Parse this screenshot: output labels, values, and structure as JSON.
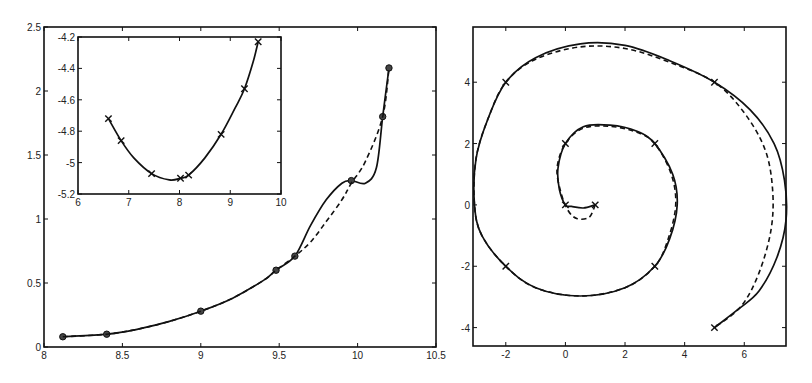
{
  "chart_data": [
    {
      "id": "left",
      "type": "line",
      "title": "",
      "xlabel": "",
      "ylabel": "",
      "xlim": [
        8,
        10.5
      ],
      "ylim": [
        0,
        2.5
      ],
      "xticks": [
        8,
        8.5,
        9,
        9.5,
        10,
        10.5
      ],
      "xtick_labels": [
        "8",
        "8.5",
        "9",
        "9.5",
        "10",
        "10.5"
      ],
      "yticks": [
        0,
        0.5,
        1,
        1.5,
        2,
        2.5
      ],
      "ytick_labels": [
        "0",
        "0.5",
        "1",
        "1.5",
        "2",
        "2.5"
      ],
      "grid": false,
      "legend": null,
      "series": [
        {
          "name": "solid",
          "style": "solid",
          "marker": "circle",
          "x": [
            8.12,
            8.4,
            9.0,
            9.48,
            9.6,
            9.96,
            10.16,
            10.2
          ],
          "y": [
            0.08,
            0.1,
            0.28,
            0.6,
            0.71,
            1.3,
            1.8,
            2.18
          ],
          "curve": [
            [
              8.12,
              0.08
            ],
            [
              8.4,
              0.1
            ],
            [
              8.6,
              0.14
            ],
            [
              8.8,
              0.2
            ],
            [
              9.0,
              0.28
            ],
            [
              9.2,
              0.38
            ],
            [
              9.4,
              0.52
            ],
            [
              9.48,
              0.6
            ],
            [
              9.6,
              0.71
            ],
            [
              9.7,
              0.95
            ],
            [
              9.8,
              1.15
            ],
            [
              9.9,
              1.28
            ],
            [
              9.96,
              1.3
            ],
            [
              10.05,
              1.28
            ],
            [
              10.12,
              1.4
            ],
            [
              10.16,
              1.8
            ],
            [
              10.2,
              2.18
            ]
          ]
        },
        {
          "name": "dashed",
          "style": "dashed",
          "marker": "none",
          "curve": [
            [
              8.12,
              0.08
            ],
            [
              8.4,
              0.1
            ],
            [
              8.6,
              0.14
            ],
            [
              8.8,
              0.2
            ],
            [
              9.0,
              0.28
            ],
            [
              9.2,
              0.38
            ],
            [
              9.4,
              0.52
            ],
            [
              9.48,
              0.6
            ],
            [
              9.6,
              0.71
            ],
            [
              9.7,
              0.82
            ],
            [
              9.8,
              0.98
            ],
            [
              9.9,
              1.15
            ],
            [
              9.96,
              1.28
            ],
            [
              10.05,
              1.45
            ],
            [
              10.16,
              1.8
            ],
            [
              10.2,
              2.18
            ]
          ]
        }
      ],
      "inset": {
        "type": "line",
        "xlim": [
          6,
          10
        ],
        "ylim": [
          -5.2,
          -4.2
        ],
        "xticks": [
          6,
          7,
          8,
          9,
          10
        ],
        "xtick_labels": [
          "6",
          "7",
          "8",
          "9",
          "10"
        ],
        "yticks": [
          -5.2,
          -5,
          -4.8,
          -4.6,
          -4.4,
          -4.2
        ],
        "ytick_labels": [
          "-5.2",
          "-5",
          "-4.8",
          "-4.6",
          "-4.4",
          "-4.2"
        ],
        "series": [
          {
            "name": "solid",
            "style": "solid",
            "marker": "x",
            "x": [
              6.6,
              6.85,
              7.45,
              8.02,
              8.18,
              8.82,
              9.28,
              9.55
            ],
            "y": [
              -4.72,
              -4.86,
              -5.07,
              -5.1,
              -5.08,
              -4.82,
              -4.53,
              -4.23
            ],
            "curve": [
              [
                6.6,
                -4.72
              ],
              [
                6.85,
                -4.86
              ],
              [
                7.1,
                -4.97
              ],
              [
                7.45,
                -5.07
              ],
              [
                7.8,
                -5.11
              ],
              [
                8.02,
                -5.1
              ],
              [
                8.18,
                -5.08
              ],
              [
                8.5,
                -4.97
              ],
              [
                8.82,
                -4.82
              ],
              [
                9.1,
                -4.65
              ],
              [
                9.28,
                -4.53
              ],
              [
                9.45,
                -4.36
              ],
              [
                9.55,
                -4.23
              ]
            ]
          }
        ]
      }
    },
    {
      "id": "right",
      "type": "line",
      "title": "",
      "xlabel": "",
      "ylabel": "",
      "xlim": [
        -3.1,
        7.4
      ],
      "ylim": [
        -4.6,
        5.8
      ],
      "xticks": [
        -2,
        0,
        2,
        4,
        6
      ],
      "xtick_labels": [
        "-2",
        "0",
        "2",
        "4",
        "6"
      ],
      "yticks": [
        -4,
        -2,
        0,
        2,
        4
      ],
      "ytick_labels": [
        "-4",
        "-2",
        "0",
        "2",
        "4"
      ],
      "grid": false,
      "legend": null,
      "series": [
        {
          "name": "solid spiral",
          "style": "solid",
          "marker": "x",
          "x": [
            1,
            0,
            0,
            3,
            3,
            -2,
            -2,
            5,
            5
          ],
          "y": [
            0,
            0,
            2,
            2,
            -2,
            -2,
            4,
            4,
            -4
          ],
          "curve": [
            [
              1,
              0
            ],
            [
              0.6,
              -0.1
            ],
            [
              0.2,
              -0.05
            ],
            [
              0,
              0
            ],
            [
              -0.2,
              0.5
            ],
            [
              -0.25,
              1.2
            ],
            [
              0,
              2
            ],
            [
              0.6,
              2.55
            ],
            [
              1.5,
              2.6
            ],
            [
              2.4,
              2.4
            ],
            [
              3,
              2
            ],
            [
              3.6,
              1.0
            ],
            [
              3.75,
              0
            ],
            [
              3.5,
              -1.1
            ],
            [
              3,
              -2
            ],
            [
              2,
              -2.7
            ],
            [
              0.5,
              -2.97
            ],
            [
              -1,
              -2.7
            ],
            [
              -2,
              -2
            ],
            [
              -2.8,
              -1
            ],
            [
              -3.05,
              0
            ],
            [
              -3,
              1.5
            ],
            [
              -2.6,
              2.8
            ],
            [
              -2,
              4
            ],
            [
              -1,
              4.8
            ],
            [
              0.5,
              5.25
            ],
            [
              2,
              5.2
            ],
            [
              3.5,
              4.7
            ],
            [
              5,
              4
            ],
            [
              6.2,
              3.1
            ],
            [
              7,
              2
            ],
            [
              7.35,
              0.8
            ],
            [
              7.4,
              -0.5
            ],
            [
              7.1,
              -1.7
            ],
            [
              6.5,
              -2.8
            ],
            [
              5.8,
              -3.4
            ],
            [
              5,
              -4
            ]
          ]
        },
        {
          "name": "dashed spiral",
          "style": "dashed",
          "marker": "none",
          "curve": [
            [
              1,
              0
            ],
            [
              0.8,
              -0.4
            ],
            [
              0.4,
              -0.45
            ],
            [
              0.1,
              -0.2
            ],
            [
              -0.15,
              0.4
            ],
            [
              -0.28,
              1.2
            ],
            [
              0,
              2
            ],
            [
              0.6,
              2.5
            ],
            [
              1.5,
              2.56
            ],
            [
              2.4,
              2.37
            ],
            [
              3,
              2
            ],
            [
              3.55,
              1.0
            ],
            [
              3.7,
              0
            ],
            [
              3.45,
              -1.1
            ],
            [
              3,
              -2
            ],
            [
              2,
              -2.7
            ],
            [
              0.5,
              -2.97
            ],
            [
              -1,
              -2.7
            ],
            [
              -2,
              -2
            ],
            [
              -2.8,
              -1
            ],
            [
              -3.05,
              0
            ],
            [
              -3,
              1.5
            ],
            [
              -2.6,
              2.8
            ],
            [
              -2,
              4
            ],
            [
              -1,
              4.75
            ],
            [
              0.5,
              5.15
            ],
            [
              2,
              5.1
            ],
            [
              3.5,
              4.65
            ],
            [
              5,
              4
            ],
            [
              6,
              3.0
            ],
            [
              6.7,
              1.8
            ],
            [
              6.95,
              0.5
            ],
            [
              6.9,
              -0.8
            ],
            [
              6.5,
              -2.2
            ],
            [
              5.9,
              -3.3
            ],
            [
              5,
              -4
            ]
          ]
        }
      ]
    }
  ]
}
